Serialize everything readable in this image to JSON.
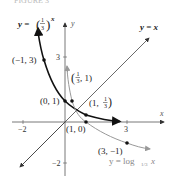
{
  "caption_partial": "FIGURE 3",
  "axes": {
    "x_label": "x",
    "y_label": "y",
    "x_ticks": [
      {
        "value": -2,
        "label": "-2"
      },
      {
        "value": 3,
        "label": "3"
      }
    ],
    "y_ticks": [
      {
        "value": 3,
        "label": "3"
      },
      {
        "value": -2,
        "label": "-2"
      }
    ]
  },
  "curves": [
    {
      "name": "exponential",
      "label": "y = (1/3)^x",
      "color": "#222222"
    },
    {
      "name": "identity",
      "label": "y = x",
      "color": "#444444"
    },
    {
      "name": "logarithm",
      "label": "y = log_{1/3} x",
      "color": "#888888"
    }
  ],
  "points": [
    {
      "label": "(-1, 3)",
      "x": -1,
      "y": 3
    },
    {
      "label": "(0, 1)",
      "x": 0,
      "y": 1
    },
    {
      "label": "(1, 1/3)",
      "x": 1,
      "y": 0.3333
    },
    {
      "label": "(1/3, 1)",
      "x": 0.3333,
      "y": 1
    },
    {
      "label": "(1, 0)",
      "x": 1,
      "y": 0
    },
    {
      "label": "(3, -1)",
      "x": 3,
      "y": -1
    }
  ],
  "labels": {
    "exp_y": "y = ",
    "exp_num": "1",
    "exp_den": "3",
    "exp_pow": "x",
    "identity": "y = x",
    "log_main": "y = log",
    "log_sub": "1/3",
    "log_x": "x",
    "pt_m1_3": "(−1, 3)",
    "pt_0_1": "(0, 1)",
    "pt_1_0": "(1, 0)",
    "pt_3_m1": "(3, −1)",
    "pt_third_1_open": "(",
    "pt_third_1_rest": ", 1)",
    "pt_1_third_open": "(1, ",
    "pt_1_third_close": ")",
    "frac_num": "1",
    "frac_den": "3",
    "tick_x_m2": "−2",
    "tick_x_3": "3",
    "tick_y_3": "3",
    "tick_y_m2": "−2",
    "axis_x": "x",
    "axis_y": "y",
    "caption": "FIGURE 3"
  }
}
